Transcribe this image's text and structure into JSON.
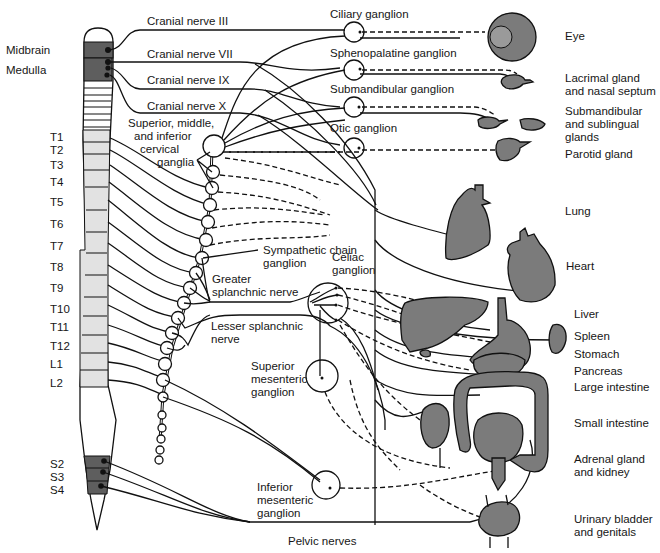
{
  "figure": {
    "type": "anatomical-diagram"
  },
  "colors": {
    "organ_fill": "#7b7b7b",
    "cord_dark": "#5e5e5e",
    "cord_light": "#e2e2e2",
    "line": "#111111",
    "background": "#ffffff"
  },
  "cord_labels": {
    "midbrain": "Midbrain",
    "medulla": "Medulla",
    "segments": [
      "T1",
      "T2",
      "T3",
      "T4",
      "T5",
      "T6",
      "T7",
      "T8",
      "T9",
      "T10",
      "T11",
      "T12",
      "L1",
      "L2"
    ],
    "sacral": [
      "S2",
      "S3",
      "S4"
    ]
  },
  "cranial_nerves": [
    {
      "label": "Cranial nerve III"
    },
    {
      "label": "Cranial nerve VII"
    },
    {
      "label": "Cranial nerve IX"
    },
    {
      "label": "Cranial nerve X"
    }
  ],
  "head_ganglia": [
    {
      "label": "Ciliary ganglion"
    },
    {
      "label": "Sphenopalatine ganglion"
    },
    {
      "label": "Submandibular ganglion"
    },
    {
      "label": "Otic ganglion"
    }
  ],
  "trunk_labels": {
    "cervical_ganglia": [
      "Superior, middle,",
      "and inferior",
      "cervical",
      "ganglia"
    ],
    "sympathetic_chain": [
      "Sympathetic chain",
      "ganglion"
    ],
    "celiac": [
      "Celiac",
      "ganglion"
    ],
    "greater_splanchnic": [
      "Greater",
      "splanchnic nerve"
    ],
    "lesser_splanchnic": [
      "Lesser splanchnic",
      "nerve"
    ],
    "superior_mesenteric": [
      "Superior",
      "mesenteric",
      "ganglion"
    ],
    "inferior_mesenteric": [
      "Inferior",
      "mesenteric",
      "ganglion"
    ],
    "pelvic_nerves": "Pelvic nerves"
  },
  "organs": [
    {
      "label": "Eye"
    },
    {
      "label": "Lacrimal gland",
      "label2": "and nasal septum"
    },
    {
      "label": "Submandibular",
      "label2": "and sublingual",
      "label3": "glands"
    },
    {
      "label": "Parotid gland"
    },
    {
      "label": "Lung"
    },
    {
      "label": "Heart"
    },
    {
      "label": "Liver"
    },
    {
      "label": "Spleen"
    },
    {
      "label": "Stomach"
    },
    {
      "label": "Pancreas"
    },
    {
      "label": "Large intestine"
    },
    {
      "label": "Small intestine"
    },
    {
      "label": "Adrenal gland",
      "label2": "and kidney"
    },
    {
      "label": "Urinary bladder",
      "label2": "and genitals"
    }
  ]
}
